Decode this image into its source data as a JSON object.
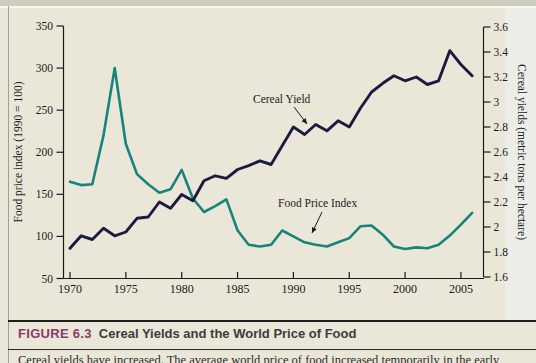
{
  "figure": {
    "label": "FIGURE 6.3",
    "title": "Cereal Yields and the World Price of Food",
    "body_text": "Cereal yields have increased. The average world price of food increased temporarily in the early"
  },
  "chart_data": {
    "type": "line",
    "x_start_year": 1970,
    "x": [
      1970,
      1971,
      1972,
      1973,
      1974,
      1975,
      1976,
      1977,
      1978,
      1979,
      1980,
      1981,
      1982,
      1983,
      1984,
      1985,
      1986,
      1987,
      1988,
      1989,
      1990,
      1991,
      1992,
      1993,
      1994,
      1995,
      1996,
      1997,
      1998,
      1999,
      2000,
      2001,
      2002,
      2003,
      2004,
      2005,
      2006
    ],
    "series": [
      {
        "name": "Food Price Index",
        "axis": "left",
        "color": "#17837a",
        "values": [
          165,
          161,
          162,
          220,
          300,
          210,
          174,
          162,
          152,
          156,
          179,
          145,
          129,
          136,
          144,
          107,
          90,
          88,
          90,
          107,
          100,
          93,
          90,
          88,
          93,
          98,
          112,
          113,
          102,
          88,
          85,
          87,
          86,
          90,
          101,
          114,
          128
        ]
      },
      {
        "name": "Cereal Yield",
        "axis": "right",
        "color": "#1b1b42",
        "values": [
          1.83,
          1.93,
          1.9,
          1.99,
          1.93,
          1.96,
          2.07,
          2.08,
          2.2,
          2.15,
          2.26,
          2.21,
          2.37,
          2.41,
          2.39,
          2.46,
          2.49,
          2.53,
          2.5,
          2.65,
          2.8,
          2.74,
          2.82,
          2.77,
          2.85,
          2.8,
          2.95,
          3.08,
          3.15,
          3.21,
          3.17,
          3.2,
          3.14,
          3.17,
          3.41,
          3.3,
          3.21
        ]
      }
    ],
    "left_axis": {
      "label": "Food price index (1990 = 100)",
      "ticks": [
        350,
        300,
        250,
        200,
        150,
        100,
        50
      ],
      "range": [
        50,
        350
      ]
    },
    "right_axis": {
      "label": "Cereal yields (metric tons per hectare)",
      "ticks": [
        3.6,
        3.4,
        3.2,
        3,
        2.8,
        2.6,
        2.4,
        2.2,
        2,
        1.8,
        1.6
      ],
      "range": [
        1.6,
        3.6
      ]
    },
    "x_axis": {
      "ticks": [
        1970,
        1975,
        1980,
        1985,
        1990,
        1995,
        2000,
        2005
      ]
    },
    "annotations": [
      {
        "text": "Cereal Yield",
        "tx": 253,
        "ty": 103,
        "ax1": 294,
        "ay1": 107,
        "ax2": 307,
        "ay2": 124
      },
      {
        "text": "Food Price Index",
        "tx": 278,
        "ty": 207,
        "ax1": 322,
        "ay1": 212,
        "ax2": 312,
        "ay2": 233
      }
    ],
    "grid": false,
    "legend": "inline-annotations"
  },
  "colors": {
    "background": "#eae7d8",
    "axis": "#1a1a1a",
    "food_price_line": "#17837a",
    "cereal_yield_line": "#1b1b42",
    "figure_label": "#8b3a6e",
    "figure_title": "#3c3c3c"
  }
}
